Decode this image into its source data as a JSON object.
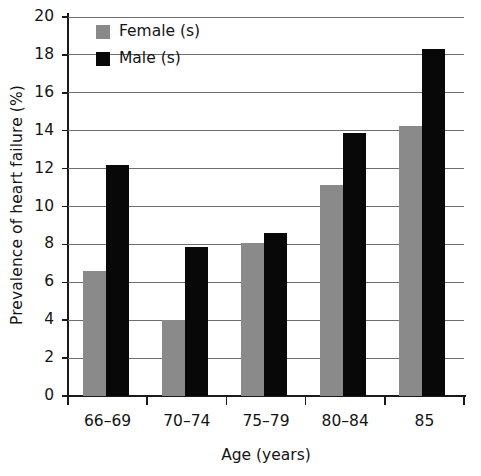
{
  "chart_data": {
    "type": "bar",
    "title": "",
    "xlabel": "Age (years)",
    "ylabel": "Prevalence of heart failure (%)",
    "categories": [
      "66–69",
      "70–74",
      "75–79",
      "80–84",
      "85"
    ],
    "series": [
      {
        "name": "Female (s)",
        "color": "#8a8a8a",
        "values": [
          6.6,
          4.0,
          8.1,
          11.15,
          14.25
        ]
      },
      {
        "name": "Male (s)",
        "color": "#080808",
        "values": [
          12.2,
          7.85,
          8.6,
          13.9,
          18.3
        ]
      }
    ],
    "ylim": [
      0,
      20
    ],
    "ytick_labels": [
      "0",
      "2",
      "4",
      "6",
      "8",
      "10",
      "12",
      "14",
      "16",
      "18",
      "20"
    ],
    "ytick_values": [
      0,
      2,
      4,
      6,
      8,
      10,
      12,
      14,
      16,
      18,
      20
    ],
    "grid": true,
    "grid_axis": "y",
    "legend_position": "top-left"
  },
  "legend": {
    "items": [
      {
        "label": "Female (s)",
        "swatch": "female-swatch"
      },
      {
        "label": "Male (s)",
        "swatch": "male-swatch"
      }
    ]
  }
}
